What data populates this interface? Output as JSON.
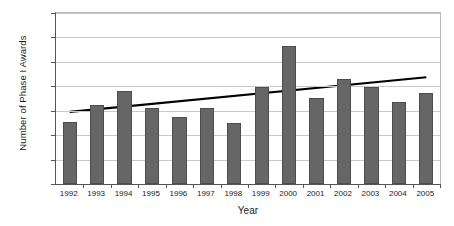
{
  "chart_data": {
    "type": "bar",
    "title": "",
    "xlabel": "Year",
    "ylabel": "Number of Phase I Awards",
    "categories": [
      "1992",
      "1993",
      "1994",
      "1995",
      "1996",
      "1997",
      "1998",
      "1999",
      "2000",
      "2001",
      "2002",
      "2003",
      "2004",
      "2005"
    ],
    "values": [
      255,
      322,
      380,
      313,
      275,
      313,
      250,
      398,
      565,
      352,
      430,
      398,
      337,
      372
    ],
    "ylim": [
      0,
      700
    ],
    "yticks": [
      0,
      100,
      200,
      300,
      400,
      500,
      600,
      700
    ],
    "ytick_labels": [
      "0",
      "100",
      "200",
      "300",
      "400",
      "500",
      "600",
      "700"
    ],
    "grid": true,
    "legend": "none",
    "series": [
      {
        "name": "Number of Phase I Awards",
        "type": "bar",
        "color": "#666666",
        "values": [
          255,
          322,
          380,
          313,
          275,
          313,
          250,
          398,
          565,
          352,
          430,
          398,
          337,
          372
        ]
      },
      {
        "name": "Linear trendline",
        "type": "line",
        "color": "#000000",
        "start_value": 295,
        "end_value": 437
      }
    ],
    "bar_color": "#666666",
    "trendline_color": "#000000",
    "gridline_color": "#c8c8c8",
    "axis_color": "#555555"
  }
}
